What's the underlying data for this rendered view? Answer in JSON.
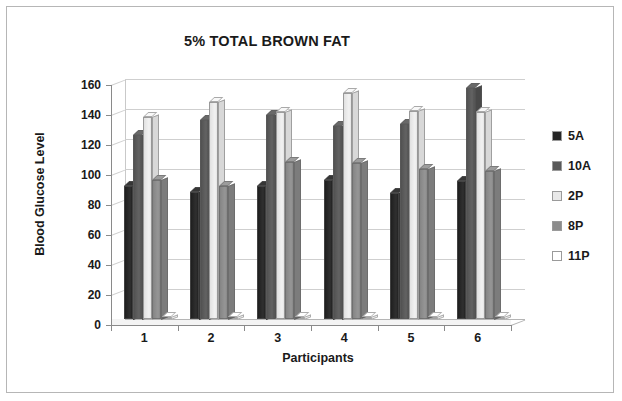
{
  "chart_data": {
    "type": "bar",
    "title": "5% TOTAL BROWN FAT",
    "xlabel": "Participants",
    "ylabel": "Blood Glucose Level",
    "categories": [
      "1",
      "2",
      "3",
      "4",
      "5",
      "6"
    ],
    "ylim": [
      0,
      160
    ],
    "ytick_step": 20,
    "yticks": [
      "0",
      "20",
      "40",
      "60",
      "80",
      "100",
      "120",
      "140",
      "160"
    ],
    "grid": true,
    "legend_position": "right",
    "style": "3d-clustered-column",
    "series": [
      {
        "name": "5A",
        "color": "#262626",
        "values": [
          89,
          85,
          89,
          93,
          84,
          92
        ]
      },
      {
        "name": "10A",
        "color": "#595959",
        "values": [
          123,
          133,
          136,
          129,
          130,
          154
        ]
      },
      {
        "name": "2P",
        "color": "#e8e8e8",
        "values": [
          135,
          145,
          138,
          151,
          139,
          138
        ]
      },
      {
        "name": "8P",
        "color": "#8c8c8c",
        "values": [
          93,
          89,
          105,
          104,
          100,
          99
        ]
      },
      {
        "name": "11P",
        "color": "#ffffff",
        "values": [
          0,
          0,
          0,
          0,
          0,
          0
        ]
      }
    ]
  },
  "legend": {
    "items": [
      {
        "label": "5A",
        "color": "#262626"
      },
      {
        "label": "10A",
        "color": "#595959"
      },
      {
        "label": "2P",
        "color": "#e8e8e8"
      },
      {
        "label": "8P",
        "color": "#8c8c8c"
      },
      {
        "label": "11P",
        "color": "#ffffff"
      }
    ]
  },
  "colors": {
    "frame_border": "#b6b6b6",
    "axis_line": "#8a8a8a",
    "gridline": "#cfcfcf",
    "text": "#1a1a1a",
    "plot_background": "#ffffff"
  }
}
